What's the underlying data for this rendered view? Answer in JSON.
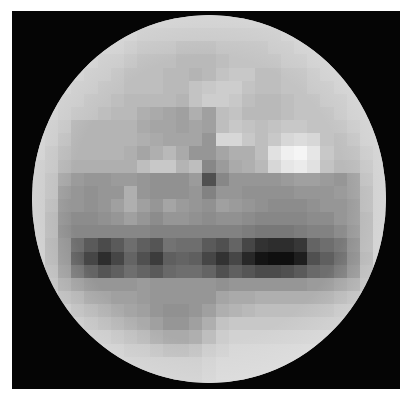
{
  "image": {
    "subject": "pixelated grayscale planetary disk",
    "background_color": "#050505",
    "page_color": "#ffffff",
    "grid": {
      "cols": 27,
      "rows": 28,
      "values": [
        [
          205,
          205,
          205,
          205,
          205,
          205,
          205,
          205,
          205,
          205,
          205,
          205,
          205,
          205,
          205,
          205,
          205,
          205,
          205,
          205,
          205,
          205,
          205,
          205,
          205,
          205,
          205
        ],
        [
          205,
          205,
          205,
          205,
          205,
          205,
          205,
          205,
          200,
          200,
          200,
          200,
          200,
          200,
          200,
          200,
          200,
          200,
          200,
          205,
          205,
          205,
          205,
          205,
          205,
          205,
          205
        ],
        [
          205,
          205,
          205,
          205,
          205,
          205,
          205,
          200,
          195,
          195,
          195,
          190,
          190,
          190,
          195,
          195,
          195,
          195,
          200,
          200,
          205,
          205,
          205,
          205,
          205,
          205,
          205
        ],
        [
          205,
          205,
          205,
          205,
          205,
          200,
          200,
          195,
          190,
          190,
          190,
          185,
          185,
          185,
          190,
          195,
          195,
          195,
          195,
          200,
          200,
          205,
          205,
          205,
          205,
          205,
          205
        ],
        [
          205,
          205,
          205,
          205,
          200,
          200,
          195,
          190,
          190,
          190,
          185,
          185,
          180,
          185,
          195,
          200,
          200,
          190,
          190,
          195,
          195,
          200,
          205,
          205,
          205,
          205,
          205
        ],
        [
          205,
          205,
          205,
          200,
          200,
          195,
          195,
          190,
          190,
          190,
          185,
          185,
          195,
          200,
          205,
          205,
          195,
          190,
          190,
          195,
          195,
          200,
          200,
          205,
          205,
          205,
          205
        ],
        [
          205,
          205,
          200,
          200,
          195,
          195,
          190,
          185,
          185,
          185,
          185,
          180,
          195,
          205,
          205,
          200,
          190,
          185,
          185,
          190,
          195,
          195,
          200,
          200,
          205,
          205,
          205
        ],
        [
          205,
          205,
          200,
          195,
          195,
          190,
          185,
          185,
          175,
          170,
          165,
          160,
          175,
          160,
          190,
          195,
          185,
          185,
          185,
          190,
          195,
          195,
          195,
          200,
          205,
          205,
          205
        ],
        [
          205,
          200,
          195,
          180,
          180,
          180,
          180,
          180,
          170,
          165,
          165,
          160,
          165,
          160,
          190,
          200,
          195,
          190,
          195,
          200,
          200,
          195,
          195,
          195,
          200,
          205,
          205
        ],
        [
          205,
          200,
          190,
          180,
          180,
          180,
          180,
          180,
          175,
          170,
          165,
          165,
          165,
          150,
          215,
          215,
          200,
          190,
          200,
          215,
          220,
          215,
          195,
          190,
          195,
          205,
          205
        ],
        [
          205,
          195,
          185,
          180,
          180,
          180,
          180,
          175,
          165,
          175,
          185,
          170,
          150,
          150,
          165,
          175,
          175,
          190,
          225,
          240,
          245,
          230,
          200,
          190,
          190,
          200,
          205
        ],
        [
          200,
          195,
          180,
          175,
          175,
          175,
          175,
          175,
          190,
          200,
          200,
          180,
          190,
          135,
          155,
          170,
          175,
          185,
          215,
          230,
          235,
          225,
          195,
          185,
          185,
          195,
          205
        ],
        [
          200,
          190,
          165,
          155,
          150,
          150,
          155,
          155,
          150,
          145,
          145,
          145,
          155,
          80,
          135,
          150,
          150,
          150,
          150,
          155,
          160,
          160,
          155,
          150,
          160,
          190,
          205
        ],
        [
          200,
          190,
          155,
          150,
          145,
          150,
          150,
          175,
          150,
          145,
          145,
          145,
          150,
          130,
          150,
          150,
          145,
          145,
          145,
          145,
          150,
          150,
          150,
          155,
          160,
          185,
          205
        ],
        [
          200,
          185,
          150,
          150,
          145,
          150,
          160,
          175,
          160,
          150,
          165,
          155,
          150,
          145,
          160,
          155,
          150,
          145,
          140,
          140,
          140,
          145,
          150,
          150,
          155,
          185,
          205
        ],
        [
          200,
          180,
          145,
          140,
          140,
          145,
          150,
          160,
          150,
          140,
          150,
          150,
          145,
          140,
          145,
          145,
          140,
          135,
          135,
          135,
          135,
          140,
          140,
          150,
          155,
          180,
          205
        ],
        [
          200,
          180,
          140,
          135,
          135,
          135,
          135,
          135,
          135,
          130,
          130,
          130,
          130,
          130,
          130,
          130,
          125,
          120,
          120,
          120,
          125,
          130,
          130,
          140,
          150,
          180,
          205
        ],
        [
          200,
          175,
          145,
          110,
          90,
          75,
          90,
          110,
          95,
          85,
          115,
          110,
          110,
          90,
          80,
          100,
          70,
          50,
          45,
          45,
          55,
          100,
          110,
          120,
          140,
          180,
          205
        ],
        [
          200,
          175,
          145,
          95,
          70,
          45,
          70,
          100,
          80,
          60,
          95,
          100,
          95,
          70,
          50,
          70,
          40,
          20,
          15,
          15,
          30,
          80,
          95,
          110,
          135,
          175,
          205
        ],
        [
          200,
          180,
          150,
          115,
          100,
          85,
          95,
          110,
          100,
          90,
          105,
          110,
          110,
          100,
          80,
          95,
          85,
          75,
          75,
          80,
          90,
          105,
          110,
          120,
          140,
          180,
          205
        ],
        [
          200,
          185,
          165,
          155,
          150,
          150,
          150,
          150,
          155,
          150,
          150,
          150,
          150,
          150,
          145,
          150,
          150,
          150,
          150,
          150,
          150,
          155,
          155,
          160,
          165,
          185,
          205
        ],
        [
          205,
          195,
          180,
          175,
          165,
          165,
          160,
          160,
          155,
          150,
          150,
          150,
          150,
          150,
          165,
          170,
          170,
          175,
          175,
          175,
          175,
          175,
          175,
          180,
          185,
          195,
          205
        ],
        [
          205,
          200,
          195,
          185,
          180,
          175,
          170,
          165,
          160,
          150,
          145,
          145,
          150,
          160,
          175,
          180,
          185,
          190,
          190,
          190,
          190,
          190,
          190,
          195,
          195,
          200,
          205
        ],
        [
          205,
          205,
          200,
          195,
          190,
          185,
          180,
          175,
          170,
          160,
          150,
          150,
          160,
          175,
          195,
          200,
          200,
          200,
          200,
          200,
          200,
          200,
          200,
          200,
          205,
          205,
          205
        ],
        [
          205,
          205,
          205,
          200,
          200,
          200,
          195,
          190,
          185,
          175,
          170,
          170,
          175,
          190,
          205,
          210,
          210,
          210,
          210,
          210,
          210,
          210,
          210,
          210,
          205,
          205,
          205
        ],
        [
          205,
          205,
          205,
          205,
          205,
          205,
          205,
          200,
          200,
          195,
          190,
          190,
          195,
          205,
          210,
          215,
          215,
          215,
          215,
          215,
          215,
          215,
          210,
          210,
          205,
          205,
          205
        ],
        [
          205,
          205,
          205,
          205,
          205,
          205,
          205,
          205,
          205,
          205,
          205,
          205,
          205,
          210,
          215,
          215,
          215,
          215,
          215,
          215,
          215,
          215,
          210,
          205,
          205,
          205,
          205
        ],
        [
          205,
          205,
          205,
          205,
          205,
          205,
          205,
          205,
          205,
          205,
          205,
          205,
          205,
          210,
          215,
          215,
          215,
          215,
          215,
          215,
          215,
          210,
          205,
          205,
          205,
          205,
          205
        ]
      ]
    }
  }
}
